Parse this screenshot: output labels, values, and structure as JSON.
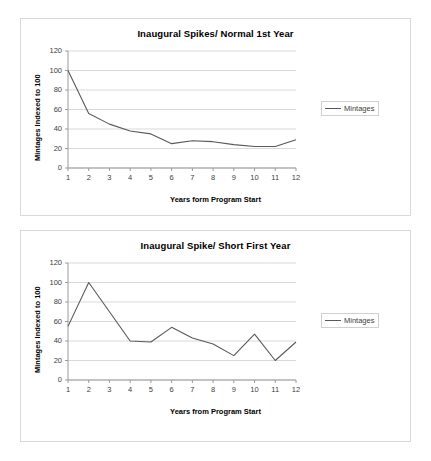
{
  "page": {
    "background": "#ffffff",
    "panel_border_color": "#d9d9d9",
    "series_color": "#595959",
    "grid_color": "#d9d9d9",
    "axis_color": "#9a9a9a",
    "tick_text_color": "#404040"
  },
  "charts": [
    {
      "id": "chart-normal-first-year",
      "chart_data": {
        "type": "line",
        "title": "Inaugural Spikes/ Normal 1st Year",
        "xlabel": "Years form Program Start",
        "ylabel": "Mintages Indexed to 100",
        "categories": [
          "1",
          "2",
          "3",
          "4",
          "5",
          "6",
          "7",
          "8",
          "9",
          "10",
          "11",
          "12"
        ],
        "x": [
          1,
          2,
          3,
          4,
          5,
          6,
          7,
          8,
          9,
          10,
          11,
          12
        ],
        "series": [
          {
            "name": "Mintages",
            "values": [
              100,
              56,
              45,
              38,
              35,
              25,
              28,
              27,
              24,
              22,
              22,
              29
            ],
            "color": "#595959"
          }
        ],
        "ylim": [
          0,
          120
        ],
        "yticks": [
          0,
          20,
          40,
          60,
          80,
          100,
          120
        ],
        "ytick_labels": [
          "0",
          "20",
          "40",
          "60",
          "80",
          "100",
          "120"
        ],
        "grid": true,
        "grid_axis": "y",
        "legend": {
          "position": "right",
          "entries": [
            "Mintages"
          ]
        }
      }
    },
    {
      "id": "chart-short-first-year",
      "chart_data": {
        "type": "line",
        "title": "Inaugural Spike/ Short First Year",
        "xlabel": "Years from Program Start",
        "ylabel": "Mintages Indexed to 100",
        "categories": [
          "1",
          "2",
          "3",
          "4",
          "5",
          "6",
          "7",
          "8",
          "9",
          "10",
          "11",
          "12"
        ],
        "x": [
          1,
          2,
          3,
          4,
          5,
          6,
          7,
          8,
          9,
          10,
          11,
          12
        ],
        "series": [
          {
            "name": "Mintages",
            "values": [
              55,
              100,
              70,
              40,
              39,
              54,
              43,
              37,
              25,
              47,
              20,
              39
            ],
            "color": "#595959"
          }
        ],
        "ylim": [
          0,
          120
        ],
        "yticks": [
          0,
          20,
          40,
          60,
          80,
          100,
          120
        ],
        "ytick_labels": [
          "0",
          "20",
          "40",
          "60",
          "80",
          "100",
          "120"
        ],
        "grid": true,
        "grid_axis": "y",
        "legend": {
          "position": "right",
          "entries": [
            "Mintages"
          ]
        }
      }
    }
  ]
}
